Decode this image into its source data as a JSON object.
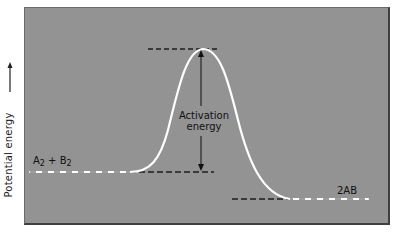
{
  "diagram": {
    "type": "energy-profile",
    "y_axis_label": "Potential energy",
    "y_axis_arrow": "up-arrow",
    "reactants_label": {
      "main_a": "A",
      "sub_a": "2",
      "plus": " + ",
      "main_b": "B",
      "sub_b": "2"
    },
    "products_label": "2AB",
    "activation_label_line1": "Activation",
    "activation_label_line2": "energy",
    "colors": {
      "panel": "#939393",
      "curve": "#ffffff",
      "dash": "#222222",
      "text": "#111111"
    },
    "levels": {
      "reactants_y": 172,
      "peak_y": 49,
      "products_y": 199
    }
  }
}
